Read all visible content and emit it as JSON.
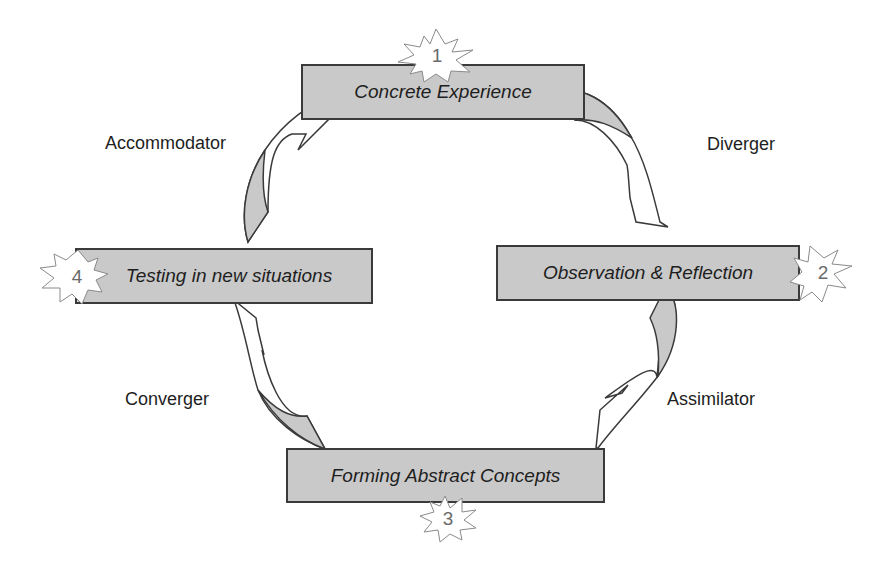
{
  "diagram": {
    "stages": [
      {
        "number": "1",
        "label": "Concrete Experience"
      },
      {
        "number": "2",
        "label": "Observation & Reflection"
      },
      {
        "number": "3",
        "label": "Forming Abstract Concepts"
      },
      {
        "number": "4",
        "label": "Testing in new situations"
      }
    ],
    "styles": [
      {
        "label": "Diverger",
        "between": "1-2"
      },
      {
        "label": "Assimilator",
        "between": "2-3"
      },
      {
        "label": "Converger",
        "between": "3-4"
      },
      {
        "label": "Accommodator",
        "between": "4-1"
      }
    ],
    "colors": {
      "box_fill": "#c9c9c9",
      "box_border": "#3a3a3a",
      "arrow_fill": "#c9c9c9",
      "star_fill": "#ffffff"
    }
  }
}
